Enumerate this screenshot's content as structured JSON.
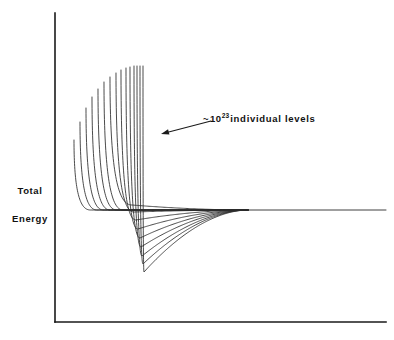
{
  "figure": {
    "background_color": "#ffffff",
    "line_color": "#2b2b2b",
    "axis_color": "#1a1a1a",
    "text_color": "#111111"
  },
  "axes": {
    "y_label_line1": "Total",
    "y_label_line2": "Energy",
    "x_label": "",
    "origin_x": 55,
    "origin_y": 322,
    "y_top": 13,
    "x_right": 386
  },
  "annotation": {
    "tilde": "~",
    "base": "10",
    "exponent": "23",
    "tail": "individual levels",
    "full_text": "~ 10^23 individual levels",
    "arrow_from_x": 211,
    "arrow_from_y": 121,
    "arrow_to_x": 161,
    "arrow_to_y": 134
  },
  "chart_data": {
    "type": "line",
    "title": "",
    "xlabel": "",
    "ylabel": "Total Energy",
    "grid": false,
    "legend": "none",
    "xlim": [
      55,
      386
    ],
    "ylim": [
      13,
      322
    ],
    "annotations": [
      {
        "text": "~ 10^23 individual levels",
        "points_to": "curve bundle",
        "x": 203,
        "y": 112
      }
    ],
    "n_curves": 15,
    "converge_x": 248,
    "converge_y": 210,
    "asymptote_y": 210,
    "asymptote_x_end": 386,
    "curves": [
      {
        "index": 0,
        "left_x": 74,
        "left_y": 140,
        "min_x": 0,
        "min_y": 0,
        "well_depth": 0,
        "width": 30,
        "has_well": false
      },
      {
        "index": 1,
        "left_x": 80,
        "left_y": 122,
        "min_x": 0,
        "min_y": 0,
        "well_depth": 0,
        "width": 31,
        "has_well": false
      },
      {
        "index": 2,
        "left_x": 86,
        "left_y": 108,
        "min_x": 0,
        "min_y": 0,
        "well_depth": 0,
        "width": 32,
        "has_well": false
      },
      {
        "index": 3,
        "left_x": 92,
        "left_y": 97,
        "min_x": 0,
        "min_y": 0,
        "well_depth": 0,
        "width": 33,
        "has_well": false
      },
      {
        "index": 4,
        "left_x": 98,
        "left_y": 89,
        "min_x": 0,
        "min_y": 0,
        "well_depth": 0,
        "width": 34,
        "has_well": false
      },
      {
        "index": 5,
        "left_x": 104,
        "left_y": 82,
        "min_x": 0,
        "min_y": 0,
        "well_depth": 0,
        "width": 35,
        "has_well": false
      },
      {
        "index": 6,
        "left_x": 110,
        "left_y": 77,
        "min_x": 132,
        "min_y": 205,
        "well_depth": 5,
        "width": 36,
        "has_well": true
      },
      {
        "index": 7,
        "left_x": 116,
        "left_y": 73,
        "min_x": 134,
        "min_y": 212,
        "well_depth": 12,
        "width": 37,
        "has_well": true
      },
      {
        "index": 8,
        "left_x": 121,
        "left_y": 70,
        "min_x": 136,
        "min_y": 220,
        "well_depth": 20,
        "width": 38,
        "has_well": true
      },
      {
        "index": 9,
        "left_x": 126,
        "left_y": 68,
        "min_x": 138,
        "min_y": 229,
        "well_depth": 29,
        "width": 39,
        "has_well": true
      },
      {
        "index": 10,
        "left_x": 130,
        "left_y": 67,
        "min_x": 140,
        "min_y": 238,
        "well_depth": 38,
        "width": 40,
        "has_well": true
      },
      {
        "index": 11,
        "left_x": 134,
        "left_y": 66,
        "min_x": 141,
        "min_y": 247,
        "well_depth": 47,
        "width": 41,
        "has_well": true
      },
      {
        "index": 12,
        "left_x": 137,
        "left_y": 66,
        "min_x": 142,
        "min_y": 256,
        "well_depth": 56,
        "width": 42,
        "has_well": true
      },
      {
        "index": 13,
        "left_x": 140,
        "left_y": 66,
        "min_x": 143,
        "min_y": 264,
        "well_depth": 64,
        "width": 43,
        "has_well": true
      },
      {
        "index": 14,
        "left_x": 143,
        "left_y": 66,
        "min_x": 144,
        "min_y": 272,
        "well_depth": 72,
        "width": 44,
        "has_well": true
      }
    ]
  }
}
